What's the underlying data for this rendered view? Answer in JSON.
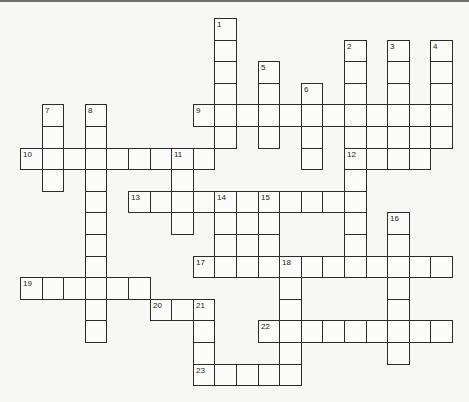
{
  "puzzle": {
    "type": "crossword",
    "grid": {
      "origin_x": 20,
      "origin_y": 18,
      "cell_size": 21.6,
      "cols": 20,
      "rows": 17
    },
    "words": [
      {
        "number": "1",
        "direction": "down",
        "row": 0,
        "col": 9,
        "length": 6
      },
      {
        "number": "2",
        "direction": "down",
        "row": 1,
        "col": 15,
        "length": 11
      },
      {
        "number": "3",
        "direction": "down",
        "row": 1,
        "col": 17,
        "length": 4
      },
      {
        "number": "4",
        "direction": "down",
        "row": 1,
        "col": 19,
        "length": 5
      },
      {
        "number": "5",
        "direction": "down",
        "row": 2,
        "col": 11,
        "length": 4
      },
      {
        "number": "6",
        "direction": "down",
        "row": 3,
        "col": 13,
        "length": 4
      },
      {
        "number": "7",
        "direction": "down",
        "row": 4,
        "col": 1,
        "length": 4
      },
      {
        "number": "8",
        "direction": "down",
        "row": 4,
        "col": 3,
        "length": 11
      },
      {
        "number": "9",
        "direction": "across",
        "row": 4,
        "col": 8,
        "length": 12
      },
      {
        "number": "10",
        "direction": "across",
        "row": 6,
        "col": 0,
        "length": 9
      },
      {
        "number": "11",
        "direction": "down",
        "row": 6,
        "col": 7,
        "length": 4
      },
      {
        "number": "12",
        "direction": "across",
        "row": 6,
        "col": 15,
        "length": 4
      },
      {
        "number": "13",
        "direction": "across",
        "row": 8,
        "col": 5,
        "length": 11
      },
      {
        "number": "14",
        "direction": "down",
        "row": 8,
        "col": 9,
        "length": 4
      },
      {
        "number": "15",
        "direction": "down",
        "row": 8,
        "col": 11,
        "length": 4
      },
      {
        "number": "16",
        "direction": "down",
        "row": 9,
        "col": 17,
        "length": 7
      },
      {
        "number": "17",
        "direction": "across",
        "row": 11,
        "col": 8,
        "length": 12
      },
      {
        "number": "18",
        "direction": "down",
        "row": 11,
        "col": 12,
        "length": 6
      },
      {
        "number": "19",
        "direction": "across",
        "row": 12,
        "col": 0,
        "length": 6
      },
      {
        "number": "20",
        "direction": "across",
        "row": 13,
        "col": 6,
        "length": 3
      },
      {
        "number": "21",
        "direction": "down",
        "row": 13,
        "col": 8,
        "length": 4
      },
      {
        "number": "22",
        "direction": "across",
        "row": 14,
        "col": 11,
        "length": 9
      },
      {
        "number": "23",
        "direction": "across",
        "row": 16,
        "col": 8,
        "length": 5
      }
    ],
    "extra_cells": [
      {
        "row": 5,
        "col": 16
      },
      {
        "row": 5,
        "col": 17
      },
      {
        "row": 5,
        "col": 18
      },
      {
        "row": 9,
        "col": 10
      },
      {
        "row": 10,
        "col": 10
      }
    ]
  }
}
